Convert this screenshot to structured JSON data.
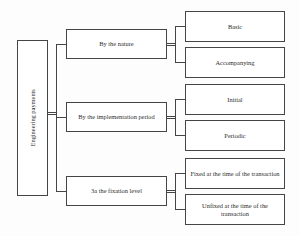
{
  "diagram": {
    "type": "hierarchy-tree",
    "root": {
      "label": "Engineering payments",
      "orientation": "vertical-text"
    },
    "categories": [
      {
        "label": "By the nature",
        "children": [
          {
            "label": "Basic"
          },
          {
            "label": "Accompanying"
          }
        ]
      },
      {
        "label": "By the implementation period",
        "children": [
          {
            "label": "Initial"
          },
          {
            "label": "Periodic"
          }
        ]
      },
      {
        "label": "3a the fixation level",
        "children": [
          {
            "label": "Fixed at the time of the transaction"
          },
          {
            "label": "Unfixed at the time of the transaction"
          }
        ]
      }
    ],
    "colors": {
      "border": "#454545",
      "text": "#2e2e2e",
      "background": "#ffffff"
    }
  }
}
